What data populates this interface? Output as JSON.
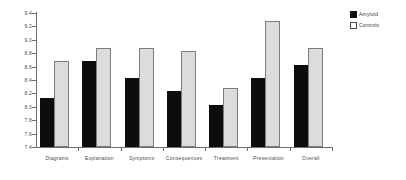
{
  "chart_data": {
    "type": "bar",
    "title": "",
    "subtitle": "",
    "xlabel": "",
    "ylabel": "",
    "ylim": [
      7.4,
      9.4
    ],
    "ytick_step": 0.2,
    "yticks": [
      "9.4",
      "9.2",
      "9.0",
      "8.8",
      "8.6",
      "8.4",
      "8.2",
      "8.0",
      "7.8",
      "7.6",
      "7.4"
    ],
    "grid": false,
    "legend_position": "right-top",
    "categories": [
      "Diagrams",
      "Explanation",
      "Symptoms",
      "Consequences",
      "Treatment",
      "Presentation",
      "Overall"
    ],
    "series": [
      {
        "name": "Amyloid",
        "color": "#0d0d0d",
        "values": [
          8.1,
          8.65,
          8.4,
          8.2,
          8.0,
          8.4,
          8.6
        ]
      },
      {
        "name": "Controls",
        "color": "#dcdcdc",
        "values": [
          8.65,
          8.85,
          8.85,
          8.8,
          8.25,
          9.25,
          8.85
        ]
      }
    ]
  },
  "legend": {
    "items": [
      {
        "label": "Amyloid"
      },
      {
        "label": "Controls"
      }
    ]
  }
}
